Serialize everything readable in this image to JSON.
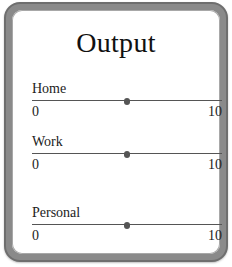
{
  "panel": {
    "title": "Output"
  },
  "sliders": [
    {
      "label": "Home",
      "min": "0",
      "max": "10",
      "value": 5
    },
    {
      "label": "Work",
      "min": "0",
      "max": "10",
      "value": 5
    },
    {
      "label": "Personal",
      "min": "0",
      "max": "10",
      "value": 5
    }
  ],
  "colors": {
    "frame": "#8a8a8a",
    "frame_edge": "#6e6e6e",
    "track": "#555555",
    "background": "#ffffff"
  }
}
